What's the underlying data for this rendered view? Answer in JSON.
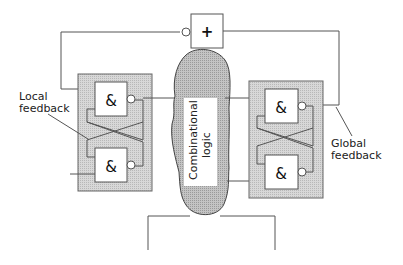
{
  "diagram": {
    "labels": {
      "local_feedback": [
        "Local",
        "feedback"
      ],
      "global_feedback": [
        "Global",
        "feedback"
      ],
      "combinational_logic": [
        "Combinational",
        "logic"
      ]
    },
    "gates": {
      "or_gate_symbol": "+",
      "and_gate_symbol": "&"
    },
    "colors": {
      "latch_fill": "#d4d4d4",
      "blob_fill": "#bdbdbd",
      "line": "#444444",
      "gate_fill": "#ffffff"
    }
  }
}
